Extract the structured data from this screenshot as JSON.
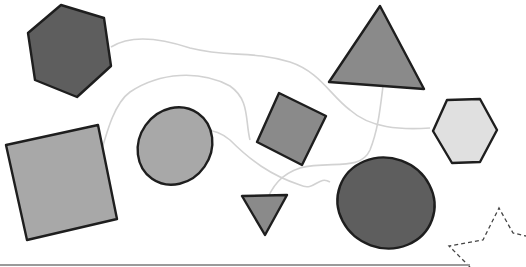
{
  "canvas": {
    "width": 526,
    "height": 267,
    "background": "#ffffff"
  },
  "colors": {
    "outline": "#1e1e1e",
    "dark_fill": "#5e5e5e",
    "mid_fill": "#8a8a8a",
    "light_fill": "#a8a8a8",
    "pale_fill": "#e0e0e0",
    "connector": "#d2d2d2",
    "dashed_outline": "#444444",
    "baseline": "#9a9a9a"
  },
  "shapes": [
    {
      "id": "hexagon-dark",
      "type": "hexagon",
      "fill": "dark_fill",
      "points": "61,5 104,18 111,66 77,97 35,80 28,33"
    },
    {
      "id": "square-large",
      "type": "square",
      "fill": "light_fill",
      "points": "6,145 98,125 117,219 27,240"
    },
    {
      "id": "ellipse-medium",
      "type": "ellipse",
      "fill": "light_fill",
      "cx": 175,
      "cy": 146,
      "rx": 36,
      "ry": 40,
      "rotate": 35
    },
    {
      "id": "diamond-square",
      "type": "square",
      "fill": "mid_fill",
      "points": "279,93 326,116 302,165 257,142"
    },
    {
      "id": "triangle-large",
      "type": "triangle",
      "fill": "mid_fill",
      "points": "380,6 424,89 329,82"
    },
    {
      "id": "triangle-small",
      "type": "triangle",
      "fill": "mid_fill",
      "points": "242,196 287,195 265,235"
    },
    {
      "id": "hexagon-light",
      "type": "hexagon",
      "fill": "pale_fill",
      "points": "447,100 480,99 497,130 480,162 452,163 433,131"
    },
    {
      "id": "ellipse-dark",
      "type": "ellipse",
      "fill": "dark_fill",
      "cx": 386,
      "cy": 203,
      "rx": 49,
      "ry": 45,
      "rotate": 20
    },
    {
      "id": "star-dashed",
      "type": "star",
      "fill": "none",
      "points": "449,246 483,240 499,208 513,233 526,236 526,267 470,267 "
    }
  ],
  "connectors": [
    {
      "id": "curve-hex-to-triangle",
      "d": "M111,47 C130,35 160,38 190,48 C230,58 250,50 290,62 C320,72 330,95 350,110 C370,128 400,130 430,128"
    },
    {
      "id": "curve-square-to-ellipse",
      "d": "M96,170 C105,140 112,105 130,92 C160,72 200,70 230,86 C250,100 245,120 250,140"
    },
    {
      "id": "curve-ellipse-to-dark",
      "d": "M192,132 C205,128 218,130 230,140 C250,160 270,175 300,185 C315,192 318,175 330,182"
    },
    {
      "id": "curve-triangle-down",
      "d": "M383,86 C380,110 378,130 370,150 C360,172 330,160 300,168 C282,174 272,185 265,205"
    }
  ],
  "baseline": {
    "x1": 0,
    "y1": 265,
    "x2": 470,
    "y2": 265
  }
}
